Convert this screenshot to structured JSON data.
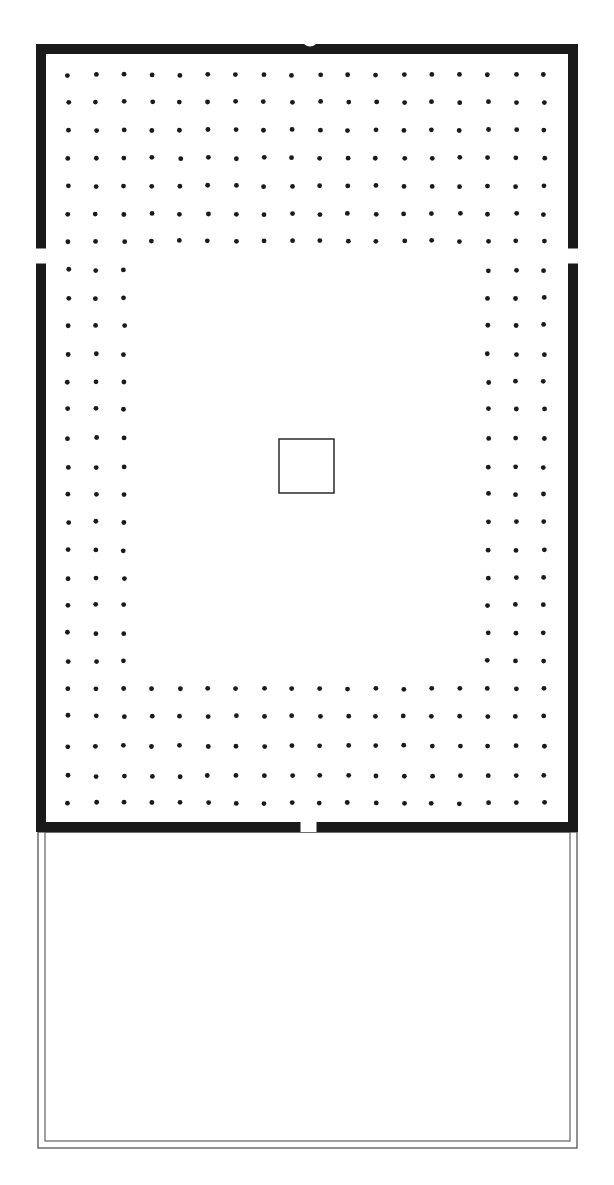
{
  "drawing": {
    "kind": "hand-drawn architectural floor plan",
    "subject": "hypostyle hall with column grid and rear annex",
    "colors": {
      "ink": "#1a1a1a",
      "paper": "#ffffff",
      "light_line": "#555555"
    }
  },
  "hall": {
    "outer_wall": {
      "x": 36,
      "y": 44,
      "w": 542,
      "h": 788,
      "thickness": 10
    },
    "top_notch": {
      "cx": 310,
      "y": 44,
      "w": 12
    },
    "door_left": {
      "x": 36,
      "y": 248,
      "w": 10,
      "h": 16
    },
    "door_right": {
      "x": 568,
      "y": 248,
      "w": 10,
      "h": 16
    },
    "door_bottom": {
      "x": 300,
      "y": 822,
      "w": 17,
      "h": 10
    }
  },
  "columns": {
    "grid_cols": 18,
    "x_start": 68,
    "x_step": 28,
    "row_ys_full_top": [
      75,
      102,
      130,
      158,
      186,
      214,
      241
    ],
    "row_ys_side": [
      270,
      298,
      325,
      354,
      382,
      409,
      438,
      467,
      494,
      522,
      550,
      578,
      605,
      633,
      661
    ],
    "row_ys_full_bottom": [
      689,
      716,
      746,
      776,
      803
    ],
    "side_band_cols": 3,
    "dot_radius": 2.4
  },
  "central_square": {
    "x": 279,
    "y": 439,
    "w": 55,
    "h": 54
  },
  "annex": {
    "outer": {
      "x": 38,
      "y": 832,
      "w": 539,
      "h": 316
    },
    "inset": 7
  },
  "labels": {
    "plan_title": "Floor plan",
    "hall_label": "Hypostyle hall",
    "annex_label": "Annex",
    "central_feature_label": "Central square"
  }
}
